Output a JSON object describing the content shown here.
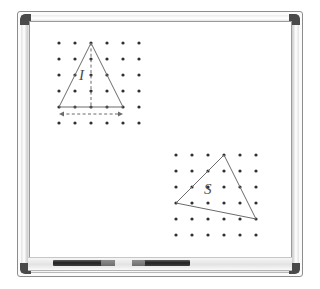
{
  "scene": {
    "title": "whiteboard-with-triangle-dot-grids",
    "board_surface_color": "#ffffff",
    "frame_color": "#e6e6e6",
    "corner_color": "#4a4a4a",
    "ink_color": "#6b6b6b",
    "dot_color": "#2f2f2f"
  },
  "tray": {
    "marker_1_label": "black-marker",
    "marker_2_label": "black-marker"
  },
  "figures": [
    {
      "id": "isosceles-triangle-figure",
      "label": "I",
      "grid": {
        "cols": 6,
        "rows": 6,
        "spacing": 16
      },
      "triangle_vertices": [
        [
          2,
          0
        ],
        [
          0,
          4
        ],
        [
          4,
          4
        ]
      ],
      "altitude": {
        "from": [
          2,
          0
        ],
        "to": [
          2,
          4
        ],
        "style": "dashed"
      },
      "base_arrow": {
        "from": [
          0,
          4.55
        ],
        "to": [
          4,
          4.55
        ],
        "style": "dashed-double-arrow"
      },
      "label_position": [
        1.35,
        2.1
      ]
    },
    {
      "id": "scalene-triangle-figure",
      "label": "S",
      "grid": {
        "cols": 6,
        "rows": 6,
        "spacing": 16
      },
      "triangle_vertices": [
        [
          3,
          0
        ],
        [
          0,
          3
        ],
        [
          5,
          4
        ]
      ],
      "label_position": [
        1.95,
        2.35
      ]
    }
  ]
}
